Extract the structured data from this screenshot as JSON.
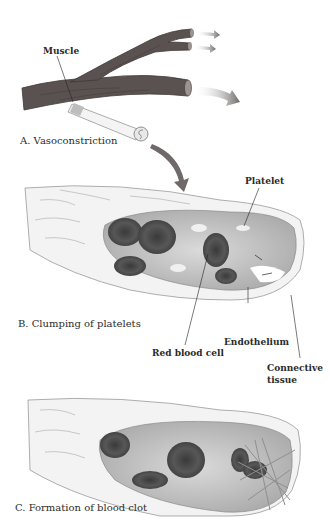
{
  "diagram": {
    "panels": [
      {
        "id": "A",
        "caption": "A. Vasoconstriction"
      },
      {
        "id": "B",
        "caption": "B. Clumping of platelets"
      },
      {
        "id": "C",
        "caption": "C. Formation of blood clot"
      }
    ],
    "labels": {
      "muscle": "Muscle",
      "platelet": "Platelet",
      "red_blood_cell": "Red blood cell",
      "endothelium": "Endothelium",
      "connective_tissue_line1": "Connective",
      "connective_tissue_line2": "tissue"
    },
    "colors": {
      "vessel": "#5a5250",
      "vessel_dark": "#3f3937",
      "arrow": "#7a7574",
      "lumen": "#c9c9c9",
      "rbc": "#4a4a4a",
      "wall": "#f2f2f2",
      "outline": "#8a8a8a"
    }
  }
}
